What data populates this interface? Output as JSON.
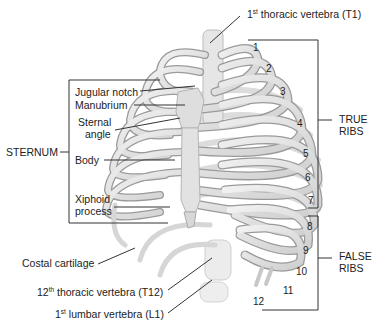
{
  "diagram": {
    "labels": {
      "t1": {
        "prefix": "1",
        "sup": "st",
        "text": " thoracic vertebra (T1)"
      },
      "sternum": "STERNUM",
      "jugular_notch": "Jugular notch",
      "manubrium": "Manubrium",
      "sternal_angle_1": "Sternal",
      "sternal_angle_2": "angle",
      "body": "Body",
      "xiphoid_1": "Xiphoid",
      "xiphoid_2": "process",
      "costal_cartilage": "Costal cartilage",
      "t12": {
        "prefix": "12",
        "sup": "th",
        "text": " thoracic vertebra (T12)"
      },
      "l1": {
        "prefix": "1",
        "sup": "st",
        "text": " lumbar vertebra (L1)"
      },
      "true_ribs_1": "TRUE",
      "true_ribs_2": "RIBS",
      "false_ribs_1": "FALSE",
      "false_ribs_2": "RIBS"
    },
    "rib_numbers": [
      "1",
      "2",
      "3",
      "4",
      "5",
      "6",
      "7",
      "8",
      "9",
      "10",
      "11",
      "12"
    ],
    "groups": {
      "true_ribs": [
        "1",
        "2",
        "3",
        "4",
        "5",
        "6",
        "7"
      ],
      "false_ribs": [
        "8",
        "9",
        "10",
        "11",
        "12"
      ]
    },
    "colors": {
      "bone": "#e4e4e4",
      "bone_edge": "#9a9a9a",
      "line": "#333333",
      "text": "#222222"
    }
  }
}
